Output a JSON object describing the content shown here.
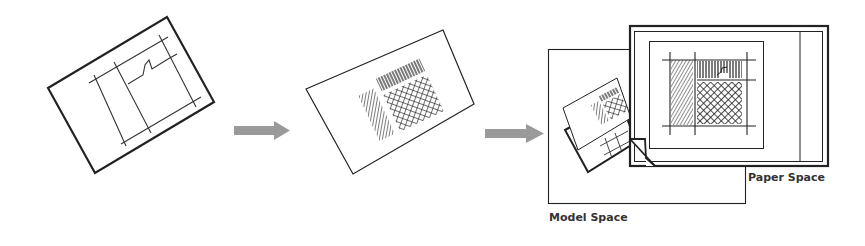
{
  "diagram": {
    "steps": [
      {
        "id": "drawing-sheet",
        "description": "Rotated drawing sheet with grid lines"
      },
      {
        "id": "hatched-sheet",
        "description": "Rotated sheet with hatch patterns"
      },
      {
        "id": "layout",
        "description": "Model space and paper space composition"
      }
    ],
    "labels": {
      "model_space": "Model Space",
      "paper_space": "Paper Space"
    },
    "colors": {
      "line": "#222222",
      "arrow": "#9a9a9a",
      "text": "#333333",
      "background": "#ffffff"
    }
  }
}
